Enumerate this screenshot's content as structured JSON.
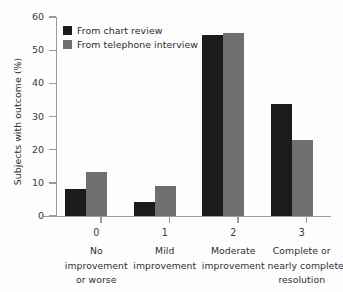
{
  "chart_data": {
    "type": "bar",
    "title": "",
    "xlabel": "",
    "ylabel": "Subjects with outcome (%)",
    "ylim": [
      0,
      60
    ],
    "yticks": [
      0,
      10,
      20,
      30,
      40,
      50,
      60
    ],
    "grid": false,
    "legend_position": "top-left",
    "categories": [
      "0",
      "1",
      "2",
      "3"
    ],
    "category_descriptions": [
      [
        "No",
        "improvement",
        "or worse"
      ],
      [
        "Mild",
        "improvement"
      ],
      [
        "Moderate",
        "improvement"
      ],
      [
        "Complete or",
        "nearly complete",
        "resolution"
      ]
    ],
    "series": [
      {
        "name": "From chart review",
        "color": "#1b1b1b",
        "values": [
          8.1,
          4.2,
          54.5,
          33.7
        ]
      },
      {
        "name": "From telephone interview",
        "color": "#6f6f6f",
        "values": [
          13.3,
          9.1,
          55.1,
          22.9
        ]
      }
    ]
  },
  "axis": {
    "y_tick_labels": [
      "0",
      "10",
      "20",
      "30",
      "40",
      "50",
      "60"
    ]
  },
  "colors": {
    "background": "#fdfdfd",
    "axis": "#9a9a9a",
    "text": "#2e2e2e",
    "series_0": "#1b1b1b",
    "series_1": "#6f6f6f"
  }
}
